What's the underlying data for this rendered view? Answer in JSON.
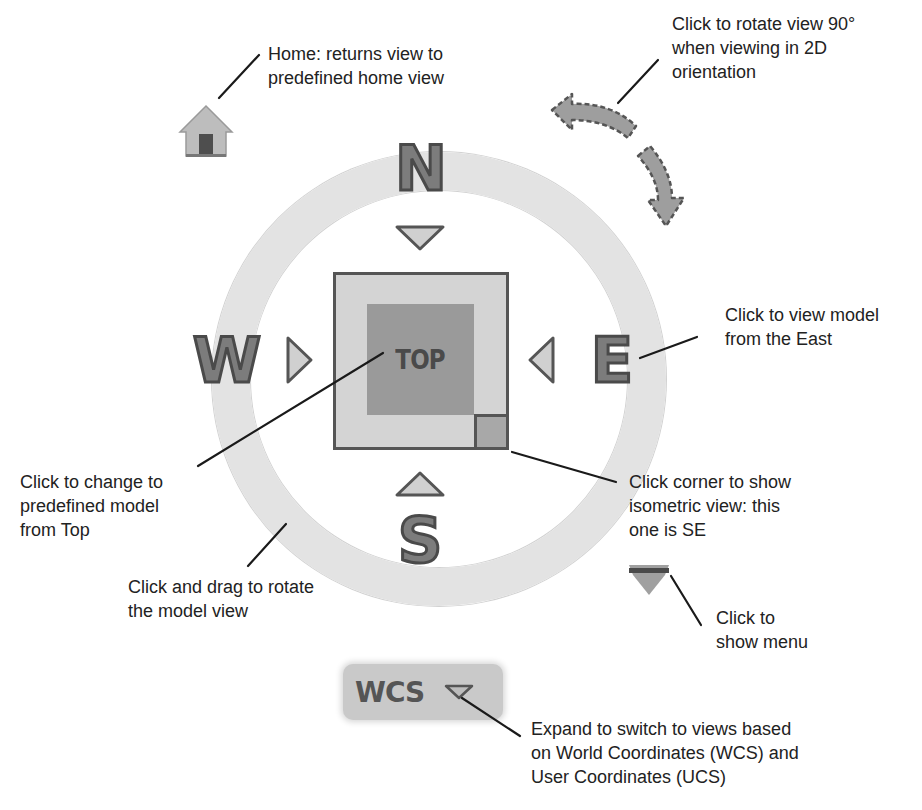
{
  "diagram": {
    "title_hint": "ViewCube navigation widget",
    "colors": {
      "ring": "#e3e3e3",
      "letters_fill": "#7c7c7c",
      "letters_stroke": "#4a4a4a",
      "cube_outer": "#d4d4d4",
      "cube_face": "#9a9a9a",
      "cube_border": "#555555",
      "leader_line": "#1a1a1a",
      "text": "#222222"
    }
  },
  "compass": {
    "north": "N",
    "south": "S",
    "east": "E",
    "west": "W"
  },
  "viewcube": {
    "face_label": "TOP",
    "corner": "SE"
  },
  "wcs_button": {
    "label": "WCS"
  },
  "icons": {
    "home": "home-icon",
    "rotate_ccw": "rotate-counterclockwise-icon",
    "rotate_cw": "rotate-clockwise-icon",
    "menu": "menu-caret-icon",
    "wcs_caret": "chevron-down-icon"
  },
  "callouts": {
    "home": [
      "Home: returns view to",
      "predefined home view"
    ],
    "rotate": [
      "Click to rotate view 90°",
      "when viewing in 2D",
      "orientation"
    ],
    "east": [
      "Click to view model",
      "from the East"
    ],
    "top": [
      "Click to change to",
      "predefined model",
      "from Top"
    ],
    "corner": [
      "Click corner to show",
      "isometric view: this",
      "one is SE"
    ],
    "ring": [
      "Click and drag to rotate",
      "the model view"
    ],
    "menu": [
      "Click to",
      "show menu"
    ],
    "wcs": [
      "Expand to switch to views based",
      "on World Coordinates (WCS) and",
      "User Coordinates (UCS)"
    ]
  }
}
